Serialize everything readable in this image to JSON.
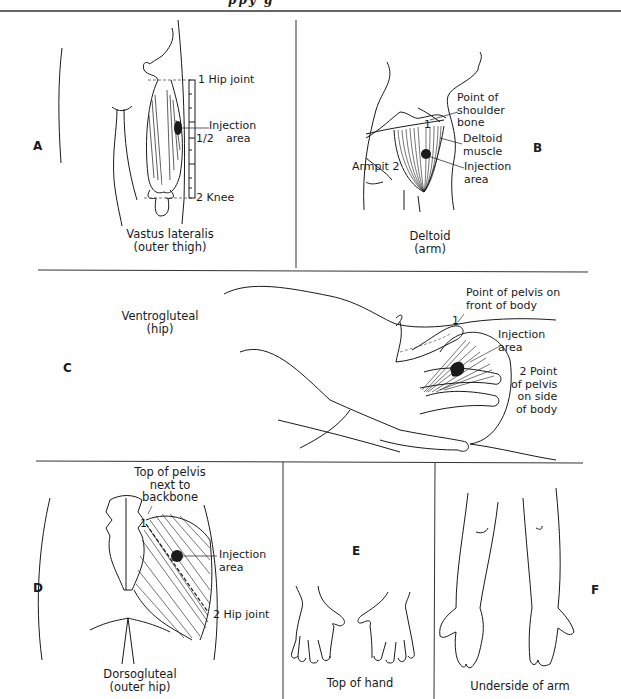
{
  "header": {
    "clipped_title": "ppy g"
  },
  "panels": {
    "A": {
      "letter": "A",
      "caption_line1": "Vastus lateralis",
      "caption_line2": "(outer thigh)",
      "labels": {
        "hip_joint": "1 Hip joint",
        "injection_1": "Injection",
        "injection_2": "area",
        "half": "1/2",
        "knee": "2 Knee"
      }
    },
    "B": {
      "letter": "B",
      "caption_line1": "Deltoid",
      "caption_line2": "(arm)",
      "labels": {
        "shoulder_1": "Point of",
        "shoulder_2": "shoulder",
        "shoulder_3": "bone",
        "one": "1",
        "deltoid_1": "Deltoid",
        "deltoid_2": "muscle",
        "injection_1": "Injection",
        "injection_2": "area",
        "armpit": "Armpit 2"
      }
    },
    "C": {
      "letter": "C",
      "caption_line1": "Ventrogluteal",
      "caption_line2": "(hip)",
      "labels": {
        "front_1": "Point of pelvis on",
        "front_2": "front of body",
        "one": "1",
        "injection_1": "Injection",
        "injection_2": "area",
        "side_1": "2 Point",
        "side_2": "of pelvis",
        "side_3": "on side",
        "side_4": "of body"
      }
    },
    "D": {
      "letter": "D",
      "caption_line1": "Dorsogluteal",
      "caption_line2": "(outer hip)",
      "labels": {
        "top_1": "Top of pelvis",
        "top_2": "next to",
        "top_3": "backbone",
        "one": "1",
        "injection_1": "Injection",
        "injection_2": "area",
        "hip": "2 Hip joint"
      }
    },
    "E": {
      "letter": "E",
      "caption": "Top of hand"
    },
    "F": {
      "letter": "F",
      "caption": "Underside of arm"
    }
  },
  "colors": {
    "ink": "#1a1a1a",
    "rule": "#333333",
    "injection": "#1a1a1a"
  }
}
